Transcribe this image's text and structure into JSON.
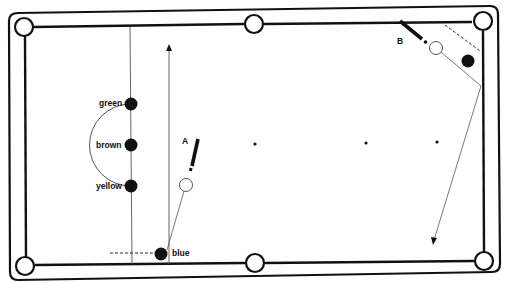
{
  "diagram": {
    "type": "snooker-table-shot-diagram",
    "colors": {
      "ink": "#111111",
      "background": "#ffffff"
    },
    "labels": {
      "shot_a": "A",
      "shot_b": "B"
    },
    "balls": [
      {
        "id": "green",
        "label": "green",
        "fill": "black"
      },
      {
        "id": "brown",
        "label": "brown",
        "fill": "black"
      },
      {
        "id": "yellow",
        "label": "yellow",
        "fill": "black"
      },
      {
        "id": "blue",
        "label": "blue",
        "fill": "black"
      },
      {
        "id": "cue-a",
        "label": "",
        "fill": "white"
      },
      {
        "id": "cue-b",
        "label": "",
        "fill": "white"
      },
      {
        "id": "object-b",
        "label": "",
        "fill": "black"
      }
    ],
    "pockets": [
      "top-left",
      "top-middle",
      "top-right",
      "bottom-left",
      "bottom-middle",
      "bottom-right"
    ],
    "spots": 3
  }
}
